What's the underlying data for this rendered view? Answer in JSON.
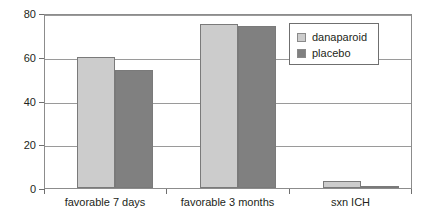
{
  "chart_data": {
    "type": "bar",
    "title": "",
    "subtitle": "",
    "xlabel": "",
    "ylabel": "",
    "categories": [
      "favorable 7 days",
      "favorable 3 months",
      "sxn ICH"
    ],
    "series": [
      {
        "name": "danaparoid",
        "color": "#cccccc",
        "values": [
          60,
          75,
          3
        ]
      },
      {
        "name": "placebo",
        "color": "#808080",
        "values": [
          54,
          74,
          1
        ]
      }
    ],
    "ylim": [
      0,
      80
    ],
    "yticks": [
      0,
      20,
      40,
      60,
      80
    ],
    "ytick_labels": [
      "0",
      "20",
      "40",
      "60",
      "80"
    ],
    "grid": true,
    "legend_position": "upper right inside plot"
  },
  "colors": {
    "series_light": "#cccccc",
    "series_dark": "#808080",
    "frame": "#8c8c8c",
    "gridline": "#9a9a9a",
    "text": "#231f20",
    "background": "#ffffff"
  }
}
